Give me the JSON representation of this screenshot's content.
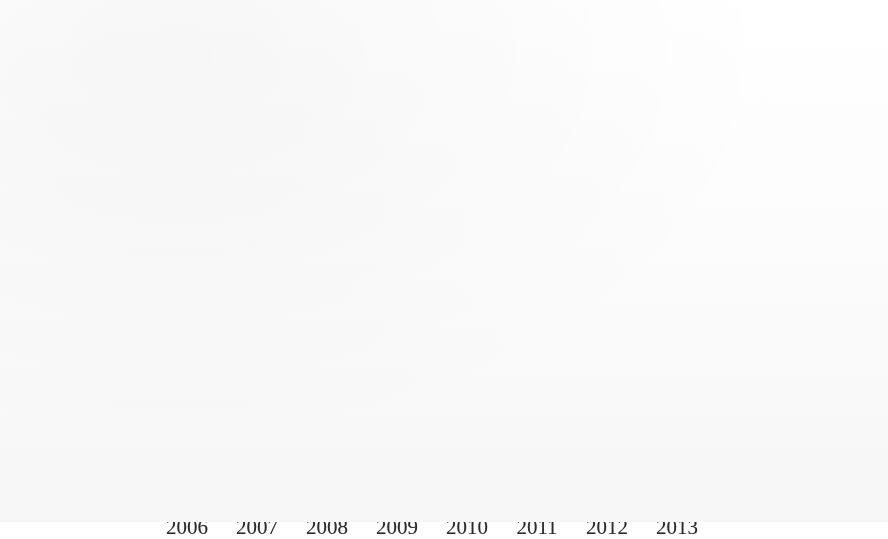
{
  "page": {
    "background_color": "#fdfdfd",
    "frame_border_color": "#8d8d8d"
  },
  "chart": {
    "title": "Children's & Young Adult Programming",
    "plot_background_top": "#a5a5a5",
    "plot_background_bottom": "#e4e4e4",
    "gridline_color": "#5c5c5c",
    "axis_color": "#5e5e5e"
  },
  "legend": {
    "position": "right",
    "items": [
      {
        "label": "No. programs",
        "color": "#6e6e6e",
        "swatch": "legend-swatch-no-programs"
      },
      {
        "label": "Attendance",
        "color": "#9a9a9a",
        "swatch": "legend-swatch-attendance"
      }
    ]
  },
  "chart_data": {
    "type": "bar",
    "title": "Children's & Young Adult Programming",
    "xlabel": "",
    "ylabel": "",
    "categories": [
      "2006",
      "2007",
      "2008",
      "2009",
      "2010",
      "2011",
      "2012",
      "2013"
    ],
    "series": [
      {
        "name": "No. programs",
        "color": "#6e6e6e",
        "values": [
          560,
          620,
          600,
          700,
          760,
          780,
          740,
          800
        ]
      },
      {
        "name": "Attendance",
        "color": "#9a9a9a",
        "values": [
          16100,
          18000,
          18100,
          19900,
          23700,
          24400,
          22200,
          22100
        ]
      }
    ],
    "ylim": [
      0,
      25000
    ],
    "yticks": [
      0,
      5000,
      10000,
      15000,
      20000,
      25000
    ],
    "ytick_labels": [
      "0",
      "5000",
      "10000",
      "15000",
      "20000",
      "25000"
    ],
    "grid": true,
    "three_d": true,
    "legend_position": "right"
  }
}
